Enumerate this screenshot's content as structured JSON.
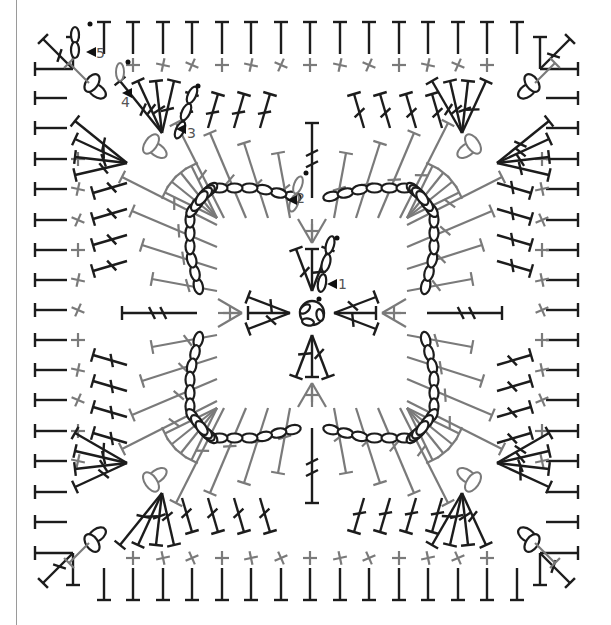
{
  "diagram": {
    "colors": {
      "dark": "#1c1c1c",
      "gray": "#7a7a7a",
      "label": "#555555",
      "background": "#ffffff"
    },
    "center": [
      312,
      313
    ],
    "round_labels": [
      {
        "text": "1",
        "x": 338,
        "y": 289,
        "arrow_x": 327,
        "arrow_y": 284
      },
      {
        "text": "2",
        "x": 296,
        "y": 203,
        "arrow_x": 287,
        "arrow_y": 200
      },
      {
        "text": "3",
        "x": 187,
        "y": 138,
        "arrow_x": 176,
        "arrow_y": 129
      },
      {
        "text": "4",
        "x": 121,
        "y": 107,
        "arrow_x": 122,
        "arrow_y": 93
      },
      {
        "text": "5",
        "x": 96,
        "y": 58,
        "arrow_x": 86,
        "arrow_y": 52
      }
    ],
    "outer_round": {
      "top_y": 22,
      "bottom_y": 600,
      "left_x": 35,
      "right_x": 578,
      "stem": 32,
      "top_xs": [
        104,
        133,
        163,
        192,
        222,
        251,
        281,
        310,
        340,
        369,
        399,
        428,
        458,
        487,
        517
      ],
      "side_ys": [
        98,
        128,
        159,
        189,
        220,
        250,
        280,
        310,
        340,
        370,
        400,
        431,
        461,
        492,
        522
      ],
      "bottom_xs": [
        104,
        133,
        163,
        192,
        222,
        251,
        281,
        310,
        340,
        369,
        399,
        428,
        458,
        487,
        517
      ]
    },
    "sc_round": {
      "top_y": 65,
      "bottom_y": 558,
      "left_x": 78,
      "right_x": 542,
      "xs": [
        133,
        163,
        192,
        222,
        251,
        281,
        310,
        340,
        369,
        399,
        428,
        458,
        487
      ],
      "ys": [
        159,
        189,
        220,
        250,
        280,
        310,
        340,
        370,
        400,
        431,
        461
      ]
    },
    "legend_note": "Rounds 1–5 marked with arrows"
  }
}
